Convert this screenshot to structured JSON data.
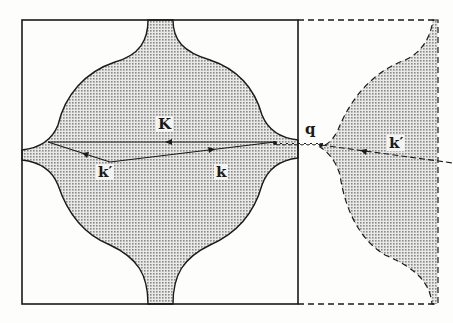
{
  "diagram": {
    "labels": {
      "K": "K",
      "k_prime_left": "k′",
      "k": "k",
      "q": "q",
      "k_prime_right": "k′"
    },
    "colors": {
      "line": "#1a1a1a",
      "shade": "#bdbdbd",
      "background": "#fdfdfc"
    }
  }
}
